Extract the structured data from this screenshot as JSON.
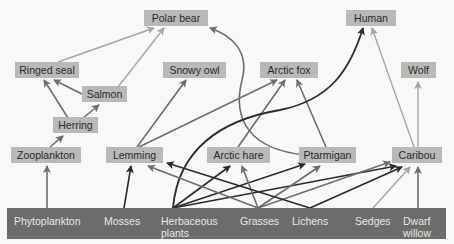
{
  "diagram": {
    "colors": {
      "background": "#f8f8f7",
      "node_fill": "#b9b9b8",
      "producer_bar": "#6c6c6b",
      "arrow_dark": "#2b2b2b",
      "arrow_mid": "#6e6e6e",
      "arrow_light": "#a6a6a6"
    },
    "consumers": {
      "polar_bear": "Polar bear",
      "human": "Human",
      "ringed_seal": "Ringed seal",
      "snowy_owl": "Snowy owl",
      "arctic_fox": "Arctic fox",
      "wolf": "Wolf",
      "salmon": "Salmon",
      "herring": "Herring",
      "zooplankton": "Zooplankton",
      "lemming": "Lemming",
      "arctic_hare": "Arctic hare",
      "ptarmigan": "Ptarmigan",
      "caribou": "Caribou"
    },
    "producers": {
      "phytoplankton": "Phytoplankton",
      "mosses": "Mosses",
      "herbaceous_line1": "Herbaceous",
      "herbaceous_line2": "plants",
      "grasses": "Grasses",
      "lichens": "Lichens",
      "sedges": "Sedges",
      "dwarf_willow_line1": "Dwarf",
      "dwarf_willow_line2": "willow"
    },
    "edges": [
      {
        "from": "Phytoplankton",
        "to": "Zooplankton"
      },
      {
        "from": "Zooplankton",
        "to": "Herring"
      },
      {
        "from": "Herring",
        "to": "Ringed seal"
      },
      {
        "from": "Herring",
        "to": "Salmon"
      },
      {
        "from": "Salmon",
        "to": "Ringed seal"
      },
      {
        "from": "Salmon",
        "to": "Polar bear"
      },
      {
        "from": "Ringed seal",
        "to": "Polar bear"
      },
      {
        "from": "Ptarmigan",
        "to": "Polar bear"
      },
      {
        "from": "Mosses",
        "to": "Lemming"
      },
      {
        "from": "Lemming",
        "to": "Snowy owl"
      },
      {
        "from": "Lemming",
        "to": "Arctic fox"
      },
      {
        "from": "Arctic hare",
        "to": "Arctic fox"
      },
      {
        "from": "Ptarmigan",
        "to": "Arctic fox"
      },
      {
        "from": "Herbaceous plants",
        "to": "Human"
      },
      {
        "from": "Herbaceous plants",
        "to": "Arctic hare"
      },
      {
        "from": "Herbaceous plants",
        "to": "Ptarmigan"
      },
      {
        "from": "Herbaceous plants",
        "to": "Caribou"
      },
      {
        "from": "Grasses",
        "to": "Lemming"
      },
      {
        "from": "Grasses",
        "to": "Arctic hare"
      },
      {
        "from": "Grasses",
        "to": "Ptarmigan"
      },
      {
        "from": "Grasses",
        "to": "Caribou"
      },
      {
        "from": "Lichens",
        "to": "Lemming"
      },
      {
        "from": "Lichens",
        "to": "Caribou"
      },
      {
        "from": "Sedges",
        "to": "Caribou"
      },
      {
        "from": "Dwarf willow",
        "to": "Caribou"
      },
      {
        "from": "Caribou",
        "to": "Wolf"
      },
      {
        "from": "Caribou",
        "to": "Human"
      }
    ]
  }
}
